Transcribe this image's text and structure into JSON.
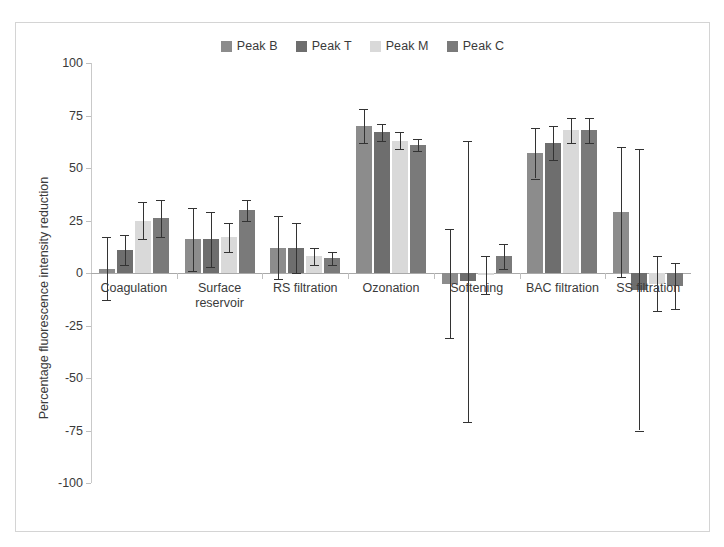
{
  "chart_data": {
    "type": "bar",
    "title": "",
    "xlabel": "",
    "ylabel": "Percentage fluorescence intensity reduction",
    "ylim": [
      -100,
      100
    ],
    "yticks": [
      100,
      75,
      50,
      25,
      0,
      -25,
      -50,
      -75,
      -100
    ],
    "grid": false,
    "legend_position": "top-center",
    "categories": [
      "Coagulation",
      "Surface reservoir",
      "RS filtration",
      "Ozonation",
      "Softening",
      "BAC filtration",
      "SS filtration"
    ],
    "series": [
      {
        "name": "Peak B",
        "color": "#8c8c8c",
        "values": [
          2,
          16,
          12,
          70,
          -5,
          57,
          29
        ],
        "errors": [
          15,
          15,
          15,
          8,
          26,
          12,
          31
        ]
      },
      {
        "name": "Peak T",
        "color": "#6e6e6e",
        "values": [
          11,
          16,
          12,
          67,
          -4,
          62,
          -8
        ],
        "errors": [
          7,
          13,
          12,
          4,
          67,
          8,
          67
        ]
      },
      {
        "name": "Peak M",
        "color": "#d9d9d9",
        "values": [
          25,
          17,
          8,
          63,
          -1,
          68,
          -5
        ],
        "errors": [
          9,
          7,
          4,
          4,
          9,
          6,
          13
        ]
      },
      {
        "name": "Peak C",
        "color": "#7a7a7a",
        "values": [
          26,
          30,
          7,
          61,
          8,
          68,
          -6
        ],
        "errors": [
          9,
          5,
          3,
          3,
          6,
          6,
          11
        ]
      }
    ]
  },
  "legend": {
    "items": [
      {
        "label": "Peak B",
        "color": "#8c8c8c"
      },
      {
        "label": "Peak T",
        "color": "#6e6e6e"
      },
      {
        "label": "Peak M",
        "color": "#d9d9d9"
      },
      {
        "label": "Peak C",
        "color": "#7a7a7a"
      }
    ]
  },
  "axis": {
    "y_title": "Percentage fluorescence intensity reduction"
  }
}
